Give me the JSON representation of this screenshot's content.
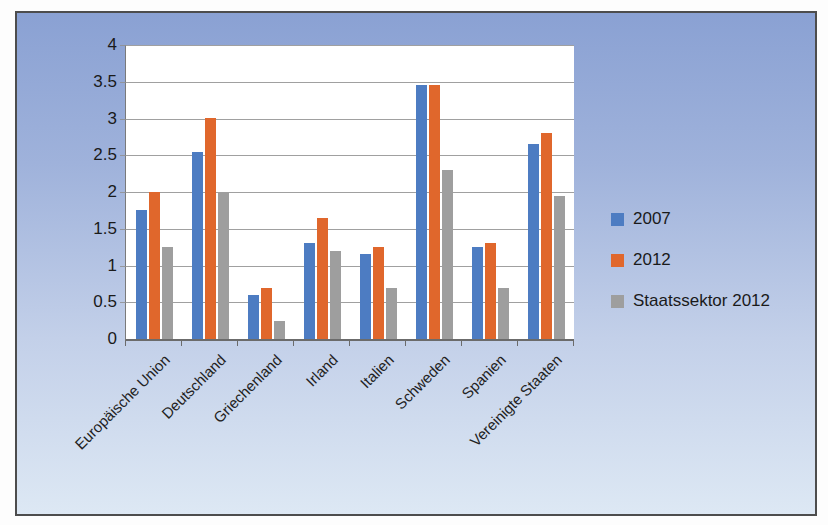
{
  "chart_data": {
    "type": "bar",
    "title": "",
    "xlabel": "",
    "ylabel": "",
    "categories": [
      "Europäische Union",
      "Deutschland",
      "Griechenland",
      "Irland",
      "Italien",
      "Schweden",
      "Spanien",
      "Vereinigte Staaten"
    ],
    "series": [
      {
        "name": "2007",
        "color": "#4d7cc2",
        "values": [
          1.75,
          2.55,
          0.6,
          1.3,
          1.15,
          3.45,
          1.25,
          2.65
        ]
      },
      {
        "name": "2012",
        "color": "#e0672c",
        "values": [
          2.0,
          3.0,
          0.7,
          1.65,
          1.25,
          3.45,
          1.3,
          2.8
        ]
      },
      {
        "name": "Staatssektor 2012",
        "color": "#9e9e9e",
        "values": [
          1.25,
          2.0,
          0.25,
          1.2,
          0.7,
          2.3,
          0.7,
          1.95
        ]
      }
    ],
    "ylim": [
      0,
      4
    ],
    "ytick_labels": [
      "4",
      "3.5",
      "3",
      "2.5",
      "2",
      "1.5",
      "1",
      "0.5",
      "0"
    ],
    "grid": true,
    "legend_position": "right"
  },
  "colors": {
    "background_top": "#8aa1d3",
    "background_bottom": "#dde8f4",
    "plot_background": "#ffffff",
    "gridline": "#8f8f8f",
    "frame_border": "#4d4d4d",
    "text": "#1a1a1a"
  }
}
